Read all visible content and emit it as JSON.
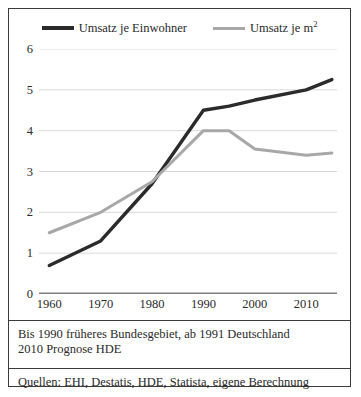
{
  "chart_data": {
    "type": "line",
    "title": "",
    "xlabel": "",
    "ylabel": "",
    "xlim": [
      1958,
      2016
    ],
    "ylim": [
      0,
      6
    ],
    "yticks": [
      0,
      1,
      2,
      3,
      4,
      5,
      6
    ],
    "xticks": [
      1960,
      1970,
      1980,
      1990,
      2000,
      2010
    ],
    "grid": "horizontal",
    "legend_position": "top",
    "x": [
      1960,
      1970,
      1980,
      1990,
      1995,
      2000,
      2010,
      2015
    ],
    "series": [
      {
        "name": "Umsatz je Einwohner",
        "color": "#2b2b2b",
        "values": [
          0.7,
          1.3,
          2.7,
          4.5,
          4.6,
          4.75,
          5.0,
          5.25
        ]
      },
      {
        "name": "Umsatz je m²",
        "color": "#a8a8a8",
        "values": [
          1.5,
          2.0,
          2.75,
          4.0,
          4.0,
          3.55,
          3.4,
          3.45
        ]
      }
    ]
  },
  "legend": {
    "entries": [
      {
        "label_text": "Umsatz je Einwohner",
        "label_sup": ""
      },
      {
        "label_text": "Umsatz je m",
        "label_sup": "2"
      }
    ]
  },
  "notes": {
    "footnotes": [
      "Bis 1990 früheres Bundesgebiet, ab 1991 Deutschland",
      "2010 Prognose HDE"
    ],
    "sources": [
      "Quellen: EHI, Destatis, HDE, Statista, eigene Berechnung"
    ]
  },
  "colors": {
    "series_einwohner": "#2b2b2b",
    "series_qm": "#a8a8a8",
    "gridline": "#d9d9d9",
    "baseline": "#808080",
    "frame": "#3b3b3b"
  }
}
